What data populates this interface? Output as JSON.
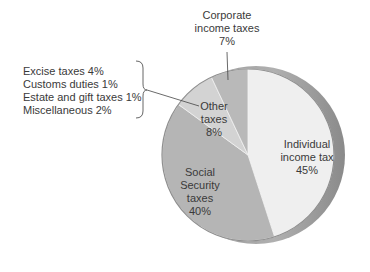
{
  "chart_data": {
    "type": "pie",
    "title": "",
    "start_angle_deg": 0,
    "direction": "clockwise",
    "slices": [
      {
        "key": "individual",
        "label": "Individual income tax",
        "label_lines": [
          "Individual",
          "income tax",
          "45%"
        ],
        "value": 45,
        "color": "#efefef"
      },
      {
        "key": "social",
        "label": "Social Security taxes",
        "label_lines": [
          "Social",
          "Security",
          "taxes",
          "40%"
        ],
        "value": 40,
        "color": "#b5b5b5"
      },
      {
        "key": "other",
        "label": "Other taxes",
        "label_lines": [
          "Other",
          "taxes",
          "8%"
        ],
        "value": 8,
        "color": "#d3d3d3"
      },
      {
        "key": "corporate",
        "label": "Corporate income taxes",
        "label_lines": [
          "Corporate",
          "income taxes",
          "7%"
        ],
        "value": 7,
        "color": "#b9b9b9"
      }
    ],
    "other_breakdown": {
      "label": "Other taxes",
      "items": [
        {
          "label": "Excise taxes",
          "value": 4,
          "text": "Excise taxes 4%"
        },
        {
          "label": "Customs duties",
          "value": 1,
          "text": "Customs duties 1%"
        },
        {
          "label": "Estate and gift taxes",
          "value": 1,
          "text": "Estate and gift taxes 1%"
        },
        {
          "label": "Miscellaneous",
          "value": 2,
          "text": "Miscellaneous 2%"
        }
      ]
    },
    "rim_color": "#9a9a9a",
    "legend": "none"
  }
}
